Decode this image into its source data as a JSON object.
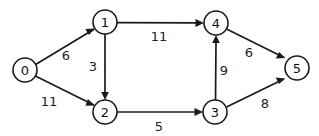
{
  "figure": {
    "kind": "directed-weighted-graph",
    "background_color": "#ffffff",
    "stroke_color": "#1a1a1a",
    "text_color": "#111111",
    "width": 319,
    "height": 136
  },
  "nodes": [
    {
      "id": "0",
      "label": "0",
      "cx": 25,
      "cy": 70,
      "r": 12
    },
    {
      "id": "1",
      "label": "1",
      "cx": 105,
      "cy": 22,
      "r": 12
    },
    {
      "id": "2",
      "label": "2",
      "cx": 105,
      "cy": 112,
      "r": 12
    },
    {
      "id": "3",
      "label": "3",
      "cx": 215,
      "cy": 112,
      "r": 12
    },
    {
      "id": "4",
      "label": "4",
      "cx": 216,
      "cy": 23,
      "r": 12
    },
    {
      "id": "5",
      "label": "5",
      "cx": 297,
      "cy": 68,
      "r": 12
    }
  ],
  "edges": [
    {
      "id": "e01",
      "from": "0",
      "to": "1",
      "weight": "6",
      "label_x": 66,
      "label_y": 55
    },
    {
      "id": "e02",
      "from": "0",
      "to": "2",
      "weight": "11",
      "label_x": 49,
      "label_y": 101
    },
    {
      "id": "e12",
      "from": "1",
      "to": "2",
      "weight": "3",
      "label_x": 93,
      "label_y": 66
    },
    {
      "id": "e14",
      "from": "1",
      "to": "4",
      "weight": "11",
      "label_x": 159,
      "label_y": 36
    },
    {
      "id": "e23",
      "from": "2",
      "to": "3",
      "weight": "5",
      "label_x": 159,
      "label_y": 126
    },
    {
      "id": "e34",
      "from": "3",
      "to": "4",
      "weight": "9",
      "label_x": 224,
      "label_y": 70
    },
    {
      "id": "e35",
      "from": "3",
      "to": "5",
      "weight": "8",
      "label_x": 265,
      "label_y": 103
    },
    {
      "id": "e45",
      "from": "4",
      "to": "5",
      "weight": "6",
      "label_x": 249,
      "label_y": 52
    }
  ]
}
